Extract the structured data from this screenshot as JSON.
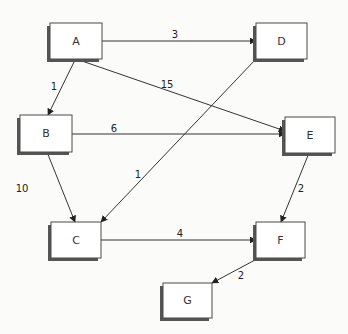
{
  "diagram": {
    "type": "directed-weighted-graph",
    "colors": {
      "background": "#fbfbf9",
      "box_fill": "#ffffff",
      "box_border": "#4a4a4a",
      "box_shadow": "#555555",
      "edge": "#333333",
      "text": "#333333"
    },
    "nodes": [
      {
        "id": "A",
        "label": "A",
        "x": 50,
        "y": 23,
        "w": 52,
        "h": 36
      },
      {
        "id": "B",
        "label": "B",
        "x": 20,
        "y": 115,
        "w": 52,
        "h": 37
      },
      {
        "id": "C",
        "label": "C",
        "x": 51,
        "y": 222,
        "w": 50,
        "h": 36
      },
      {
        "id": "D",
        "label": "D",
        "x": 256,
        "y": 23,
        "w": 51,
        "h": 36
      },
      {
        "id": "E",
        "label": "E",
        "x": 285,
        "y": 117,
        "w": 50,
        "h": 36
      },
      {
        "id": "F",
        "label": "F",
        "x": 256,
        "y": 222,
        "w": 49,
        "h": 36
      },
      {
        "id": "G",
        "label": "G",
        "x": 163,
        "y": 283,
        "w": 49,
        "h": 35
      }
    ],
    "edges": [
      {
        "from": "A",
        "to": "D",
        "weight": "3",
        "x1": 102,
        "y1": 41,
        "x2": 256,
        "y2": 41,
        "lx": 175,
        "ly": 34
      },
      {
        "from": "A",
        "to": "B",
        "weight": "1",
        "x1": 75,
        "y1": 60,
        "x2": 48,
        "y2": 115,
        "lx": 54,
        "ly": 86
      },
      {
        "from": "A",
        "to": "E",
        "weight": "15",
        "x1": 79,
        "y1": 60,
        "x2": 285,
        "y2": 131,
        "lx": 167,
        "ly": 84
      },
      {
        "from": "B",
        "to": "E",
        "weight": "6",
        "x1": 72,
        "y1": 134,
        "x2": 285,
        "y2": 134,
        "lx": 114,
        "ly": 128
      },
      {
        "from": "D",
        "to": "C",
        "weight": "1",
        "x1": 255,
        "y1": 60,
        "x2": 101,
        "y2": 222,
        "lx": 138,
        "ly": 174
      },
      {
        "from": "B",
        "to": "C",
        "weight": "10",
        "x1": 47,
        "y1": 152,
        "x2": 75,
        "y2": 222,
        "lx": 22,
        "ly": 188
      },
      {
        "from": "E",
        "to": "F",
        "weight": "2",
        "x1": 309,
        "y1": 153,
        "x2": 281,
        "y2": 222,
        "lx": 301,
        "ly": 188
      },
      {
        "from": "C",
        "to": "F",
        "weight": "4",
        "x1": 101,
        "y1": 240,
        "x2": 256,
        "y2": 240,
        "lx": 180,
        "ly": 233
      },
      {
        "from": "F",
        "to": "G",
        "weight": "2",
        "x1": 255,
        "y1": 260,
        "x2": 212,
        "y2": 283,
        "lx": 241,
        "ly": 275
      }
    ]
  }
}
